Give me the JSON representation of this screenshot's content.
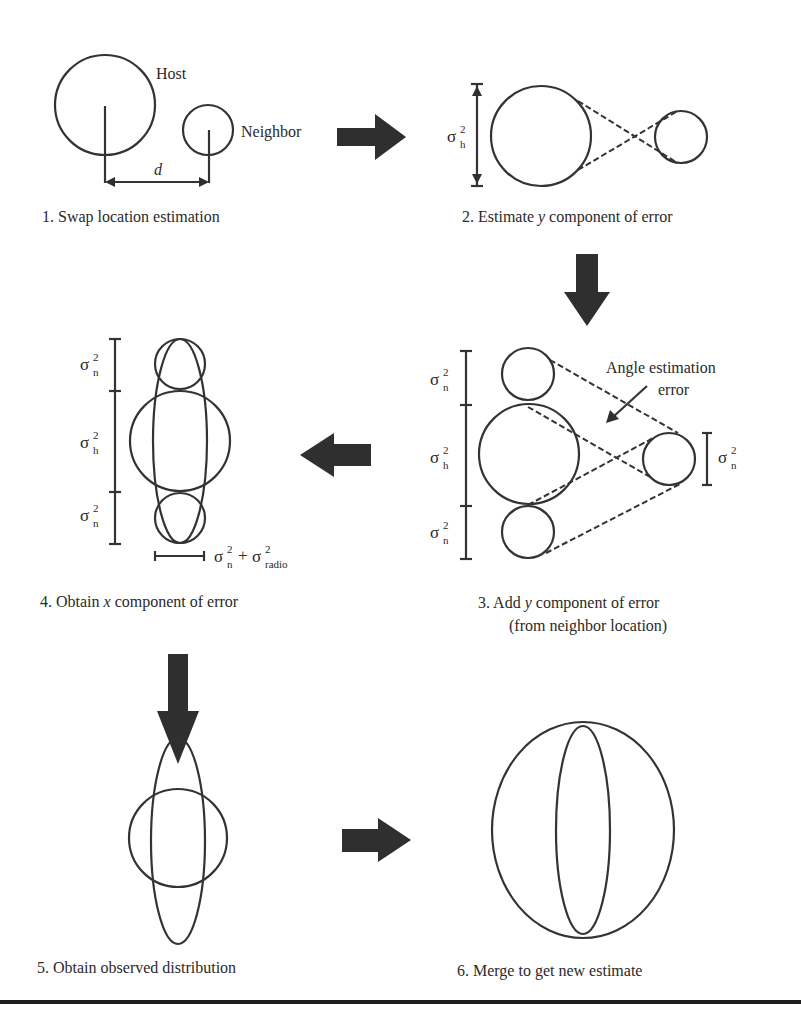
{
  "panels": [
    {
      "id": 1,
      "caption": "1. Swap location estimation",
      "labels": {
        "host": "Host",
        "neighbor": "Neighbor",
        "distance": "d"
      }
    },
    {
      "id": 2,
      "caption_pre": "2. Estimate ",
      "caption_var": "y",
      "caption_post": " component of error",
      "sigma": {
        "base": "σ",
        "sup": "2",
        "sub": "h"
      }
    },
    {
      "id": 3,
      "caption_line1_pre": "3. Add ",
      "caption_line1_var": "y",
      "caption_line1_post": " component of error",
      "caption_line2": "(from neighbor location)",
      "annotation_line1": "Angle estimation",
      "annotation_line2": "error",
      "sigmas": [
        {
          "base": "σ",
          "sup": "2",
          "sub": "n"
        },
        {
          "base": "σ",
          "sup": "2",
          "sub": "h"
        },
        {
          "base": "σ",
          "sup": "2",
          "sub": "n"
        },
        {
          "base": "σ",
          "sup": "2",
          "sub": "n"
        }
      ]
    },
    {
      "id": 4,
      "caption_pre": "4. Obtain ",
      "caption_var": "x",
      "caption_post": " component of error",
      "sigmas": [
        {
          "base": "σ",
          "sup": "2",
          "sub": "n"
        },
        {
          "base": "σ",
          "sup": "2",
          "sub": "h"
        },
        {
          "base": "σ",
          "sup": "2",
          "sub": "n"
        }
      ],
      "width_label": {
        "a_base": "σ",
        "a_sup": "2",
        "a_sub": "n",
        "plus": "+",
        "b_base": "σ",
        "b_sup": "2",
        "b_sub": "radio"
      }
    },
    {
      "id": 5,
      "caption": "5. Obtain observed distribution"
    },
    {
      "id": 6,
      "caption": "6. Merge to get new estimate"
    }
  ],
  "colors": {
    "ink": "#2a2a2a",
    "arrow": "#2f2f2f",
    "background": "#ffffff"
  }
}
